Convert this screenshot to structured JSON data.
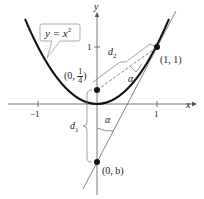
{
  "figure": {
    "axes": {
      "x_label": "x",
      "y_label": "y",
      "x_ticks": [
        "−1",
        "1"
      ],
      "y_ticks": [
        "1"
      ]
    },
    "curve_label": "y = x",
    "curve_label_exp": "2",
    "points": {
      "focus": {
        "prefix": "(0, ",
        "num": "1",
        "den": "4",
        "suffix": ")"
      },
      "tangent_point": "(1, 1)",
      "y_intercept": "(0, b)"
    },
    "distances": {
      "d1": "d",
      "d1_sub": "1",
      "d2": "d",
      "d2_sub": "2"
    },
    "angle_label": "α",
    "colors": {
      "curve": "#111111",
      "axis": "#555555",
      "guide": "#777777"
    }
  }
}
